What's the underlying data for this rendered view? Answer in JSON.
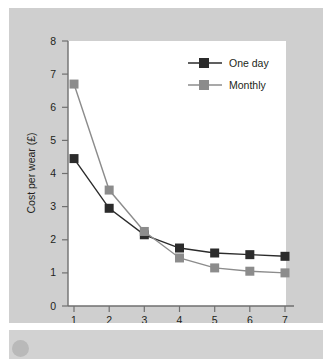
{
  "chart_data": {
    "type": "line",
    "title": "",
    "xlabel": "Wears per week",
    "ylabel": "Cost per wear (£)",
    "x": [
      1,
      2,
      3,
      4,
      5,
      6,
      7
    ],
    "xticklabels": [
      "1",
      "2",
      "3",
      "4",
      "5",
      "6",
      "7"
    ],
    "yticklabels": [
      "0",
      "1",
      "2",
      "3",
      "4",
      "5",
      "6",
      "7",
      "8"
    ],
    "xlim": [
      0.6,
      7.4
    ],
    "ylim": [
      0,
      8
    ],
    "grid": false,
    "legend_position": "top-right",
    "series": [
      {
        "name": "One day",
        "color": "#2b2b2b",
        "marker": "square",
        "values": [
          4.45,
          2.95,
          2.15,
          1.75,
          1.6,
          1.55,
          1.5
        ]
      },
      {
        "name": "Monthly",
        "color": "#8c8c8c",
        "marker": "square",
        "values": [
          6.7,
          3.5,
          2.25,
          1.45,
          1.15,
          1.05,
          1.0
        ]
      }
    ]
  },
  "legend": {
    "entries": [
      {
        "label": "One day"
      },
      {
        "label": "Monthly"
      }
    ]
  },
  "axes": {
    "x_title": "Wears per week",
    "y_title": "Cost per wear (£)",
    "x_ticks": [
      "1",
      "2",
      "3",
      "4",
      "5",
      "6",
      "7"
    ],
    "y_ticks": [
      "0",
      "1",
      "2",
      "3",
      "4",
      "5",
      "6",
      "7",
      "8"
    ]
  },
  "colors": {
    "series_one_day": "#2b2b2b",
    "series_monthly": "#8c8c8c",
    "figure_background": "#cfcfcf",
    "plot_background": "#ffffff",
    "axis": "#6f6f6f",
    "text": "#231f20"
  }
}
